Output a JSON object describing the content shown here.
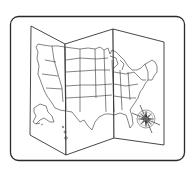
{
  "icon": {
    "name": "folded-us-map-icon",
    "subject": "Folded map of the United States with compass rose",
    "colors": {
      "stroke": "#333333",
      "frame_stroke": "#2a2a2a",
      "background": "#ffffff",
      "compass_ring": "#777777"
    },
    "parts": [
      "rounded-frame",
      "map-panel-left",
      "map-panel-middle",
      "map-panel-right",
      "state-borders",
      "alaska",
      "hawaii",
      "compass-rose"
    ]
  }
}
